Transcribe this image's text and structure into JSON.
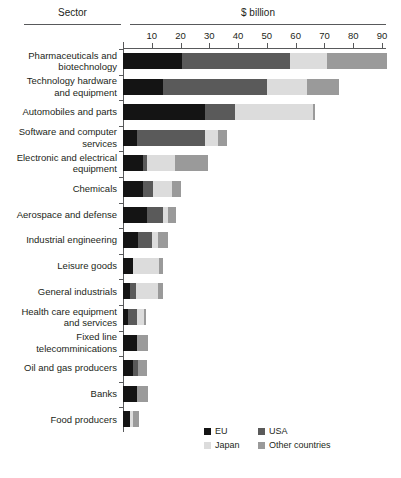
{
  "header": {
    "sector_label": "Sector",
    "unit_label": "$ billion"
  },
  "chart_data": {
    "type": "bar",
    "orientation": "horizontal",
    "stacked": true,
    "title": "",
    "xlabel": "$ billion",
    "ylabel": "Sector",
    "xlim": [
      0,
      90
    ],
    "xticks": [
      10,
      20,
      30,
      40,
      50,
      60,
      70,
      80,
      90
    ],
    "grid": false,
    "legend_position": "bottom-right",
    "series": [
      {
        "name": "EU",
        "color": "#141414",
        "values": [
          20.5,
          14.0,
          28.5,
          5.0,
          7.0,
          7.0,
          8.5,
          5.3,
          3.5,
          2.5,
          1.6,
          5.0,
          3.5,
          5.0,
          2.5
        ]
      },
      {
        "name": "USA",
        "color": "#5a5a5a",
        "values": [
          37.5,
          36.0,
          10.5,
          23.5,
          1.4,
          3.5,
          5.5,
          4.7,
          0.0,
          2.0,
          3.4,
          0.0,
          1.7,
          0.0,
          0.0
        ]
      },
      {
        "name": "Japan",
        "color": "#dcdcdc",
        "values": [
          13.0,
          14.0,
          27.0,
          4.5,
          9.7,
          6.5,
          1.6,
          2.0,
          8.9,
          7.5,
          2.4,
          0.0,
          0.0,
          0.0,
          1.0
        ]
      },
      {
        "name": "Other countries",
        "color": "#9a9a9a",
        "values": [
          20.8,
          11.0,
          0.7,
          3.0,
          11.5,
          3.0,
          2.9,
          3.6,
          1.6,
          2.0,
          0.6,
          3.7,
          3.1,
          3.7,
          2.2
        ]
      }
    ],
    "categories": [
      "Pharmaceuticals and\nbiotechnology",
      "Technology hardware\nand equipment",
      "Automobiles and parts",
      "Software and computer\nservices",
      "Electronic and electrical\nequipment",
      "Chemicals",
      "Aerospace and defense",
      "Industrial engineering",
      "Leisure goods",
      "General industrials",
      "Health care equipment\nand services",
      "Fixed line\ntelecomminications",
      "Oil and gas producers",
      "Banks",
      "Food producers"
    ],
    "totals": [
      91.8,
      75.0,
      66.7,
      36.0,
      29.6,
      20.0,
      18.5,
      15.6,
      14.0,
      14.0,
      8.0,
      8.7,
      8.3,
      8.7,
      5.7
    ]
  },
  "legend": {
    "items": [
      {
        "label": "EU",
        "color": "#141414"
      },
      {
        "label": "USA",
        "color": "#5a5a5a"
      },
      {
        "label": "Japan",
        "color": "#dcdcdc"
      },
      {
        "label": "Other countries",
        "color": "#9a9a9a"
      }
    ]
  },
  "colors": {
    "axis": "#58595b",
    "text": "#231f20",
    "background": "#ffffff"
  }
}
